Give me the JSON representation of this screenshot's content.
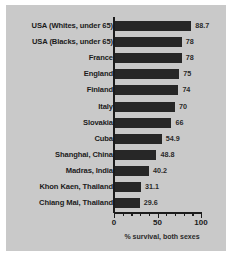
{
  "chart_data": {
    "type": "bar",
    "orientation": "horizontal",
    "title": "",
    "xlabel": "% survival, both sexes",
    "ylabel": "",
    "xlim": [
      0,
      100
    ],
    "xticks": [
      0,
      50,
      100
    ],
    "xtick_labels": [
      "0",
      "50",
      "100"
    ],
    "minor_tick_interval": 10,
    "grid": false,
    "legend": null,
    "categories": [
      "USA (Whites, under 65)",
      "USA (Blacks, under 65)",
      "France",
      "England",
      "Finland",
      "Italy",
      "Slovakia",
      "Cuba",
      "Shanghai, China",
      "Madras, India",
      "Khon Kaen, Thailand",
      "Chiang Mai, Thailand"
    ],
    "values": [
      88.7,
      78,
      78,
      75,
      74,
      70,
      66,
      54.9,
      48.8,
      40.2,
      31.1,
      29.6
    ],
    "value_labels": [
      "88.7",
      "78",
      "78",
      "75",
      "74",
      "70",
      "66",
      "54.9",
      "48.8",
      "40.2",
      "31.1",
      "29.6"
    ],
    "colors": {
      "bar": "#272727",
      "panel_background": "#c9c9c9",
      "figure_background": "#ffffff",
      "text": "#1b1b1b",
      "axis": "#1b1b1b"
    }
  }
}
